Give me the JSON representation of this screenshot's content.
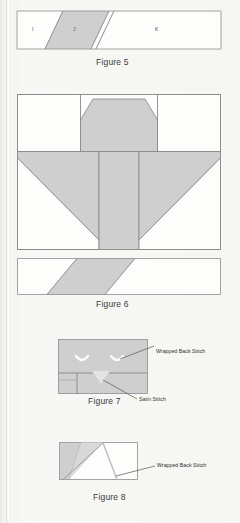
{
  "page": {
    "background_color": "#f6f6f3",
    "ink_color": "#8a8a8a",
    "shade_color": "#cfcfcf",
    "white_color": "#fdfdfc",
    "text_color": "#3a3a3a"
  },
  "figures": [
    {
      "id": "figure-5",
      "caption": "Figure 5",
      "piece_labels": [
        "I",
        "J",
        "K"
      ],
      "description": "Horizontal strip divided by two parallel diagonal seams; centre parallelogram shaded grey, outer pieces white"
    },
    {
      "id": "figure-6",
      "caption": "Figure 6",
      "piece_labels": [],
      "description": "Large pieced block: grey octagonal heart-like centre with white corner triangles and white upper-left and upper-right squares, plus a separate strip with a shaded parallelogram below"
    },
    {
      "id": "figure-7",
      "caption": "Figure 7",
      "annotations": [
        "Wrapped Back Stitch",
        "Satin Stitch"
      ],
      "description": "Grey rectangle with two embroidered crescent eyes and a satin-stitch triangular beak over a horizontal seam"
    },
    {
      "id": "figure-8",
      "caption": "Figure 8",
      "annotations": [
        "Wrapped Back Stitch"
      ],
      "description": "Small rectangle with grey left wedge and diagonal stitch lines"
    }
  ],
  "figure5": {
    "caption": "Figure 5",
    "labels": {
      "left": "I",
      "middle": "J",
      "right": "K"
    }
  },
  "figure6": {
    "caption": "Figure 6"
  },
  "figure7": {
    "caption": "Figure 7",
    "annotation_wrapped_back_stitch": "Wrapped Back Stitch",
    "annotation_satin_stitch": "Satin Stitch"
  },
  "figure8": {
    "caption": "Figure 8",
    "annotation_wrapped_back_stitch": "Wrapped Back Stitch"
  }
}
